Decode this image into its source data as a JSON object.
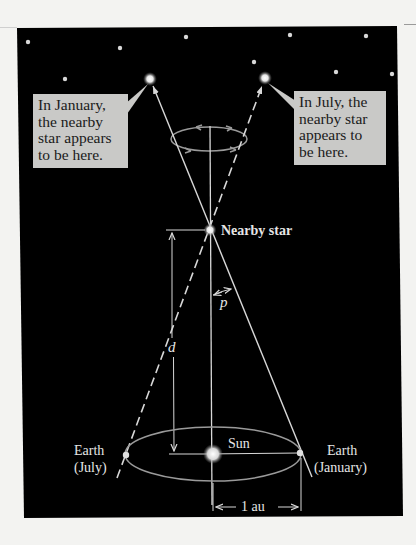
{
  "figure": {
    "colors": {
      "background_page": "#f3f3f1",
      "panel": "#000000",
      "lines": "#d8d8d8",
      "callout_box": "#c9c9c7",
      "callout_text": "#1a1a1a",
      "label_text": "#e6e6e6"
    },
    "callouts": {
      "january": {
        "lines": [
          "In January,",
          "the nearby",
          "star appears",
          "to be here."
        ]
      },
      "july": {
        "lines": [
          "In July, the",
          "nearby star",
          "appears to",
          "be here."
        ]
      }
    },
    "labels": {
      "nearby_star": "Nearby star",
      "sun": "Sun",
      "earth_july_line1": "Earth",
      "earth_july_line2": "(July)",
      "earth_january_line1": "Earth",
      "earth_january_line2": "(January)",
      "distance": "d",
      "parallax_angle": "p",
      "baseline": "1 au"
    },
    "background_stars": [
      {
        "x": 28,
        "y": 42
      },
      {
        "x": 120,
        "y": 48
      },
      {
        "x": 186,
        "y": 37
      },
      {
        "x": 254,
        "y": 62
      },
      {
        "x": 290,
        "y": 35
      },
      {
        "x": 336,
        "y": 72
      },
      {
        "x": 366,
        "y": 36
      },
      {
        "x": 392,
        "y": 74
      },
      {
        "x": 65,
        "y": 79
      }
    ]
  }
}
